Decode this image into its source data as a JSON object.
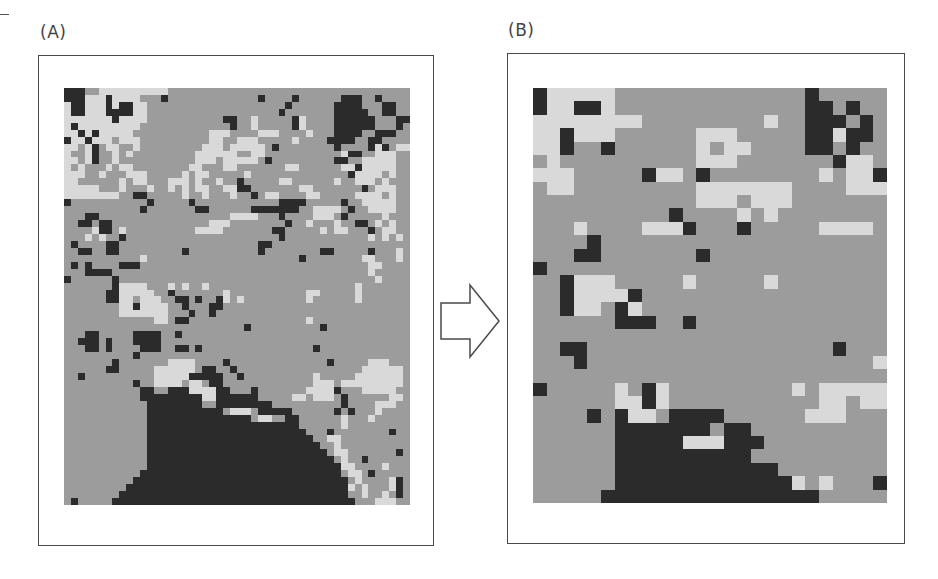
{
  "figure": {
    "panels": [
      {
        "label": "(A)",
        "description": "Fine-resolution classified grid map",
        "grid": {
          "cols": 50,
          "rows": 60,
          "legend": {
            ".": "medium grey class",
            "L": "light grey class",
            "D": "dark class"
          },
          "data": [
            "DDD..LLLLLLLLLL..................................",
            "DDDLLLDLLLL...D.............D....D......DDD..D.....",
            "LDDLLLDLDDLL....................D......DDDD...DD...",
            "LDDLLLDDDDLL...................D.......DDDDD..DD..",
            "LLLLLLLDLLLL...........DD..L.....DL....DDDDDD...DD.",
            "LDLLLLLLLLL.............D..L.....DL....DDDDDD...D.",
            "LLDLDLLLLL...........LLL....LLL....L...DDDD..DDD..",
            "DLLDLLL.LLL..........LL..LLL.....L....DDDD..DD...",
            "LL.LD.LL..L.........LLL.LLLLL.D........D....DLD.LL",
            "L..LD..L.L.........LLLLLL..LL...........LDD..LLL",
            "LL.LD..L...........LLL.LLLLL.D.........DD..LLLLL",
            "L.L...L.LL........LL...LL.......LL......LLDLLLLL.",
            "LLL..L...LLL.....L.LL.....L..............DLLLL.L",
            "LL......L.LL...LLL.L..L..D.....LL......L..LLL.L.",
            "LLLLL...L...L..L.L.LL..LLDD.......LL.......D.LLL.",
            "LLLLLLLL..DD.....L..L...L..D.LL....LL.....LLLL.L",
            "D...........D.....D............DDDD.....D..LLLLL.",
            "...........D.......DD......DDDDDDD..LLLL.D..LLLL",
            "...DD...................LLLL...D....LLL.D.....L..",
            "..DD.DD..............LLL........D..L...L..DD.L.L.",
            "....LDD.L..........LLLL.......DD.....L.LL...D.LL.",
            "...L.L..D......................D............L.L.L",
            ".D....DD....................DD....................",
            "..DD..DD.........D..........D........DD.....D...L.",
            "...........L......................D........LL...L",
            ".D.D....DDD.................................LL...",
            "...DDDD.....................................L.....",
            "D......D.....................................L....",
            ".......DLLLL...L.L..L.....................L......",
            "......DDLLLLL..D.......L...........LL.....L.....",
            "......DDLL.LLL..DD.D..DL.L.........L......L.....",
            "........LLDLLLL..D...DD.........................",
            "........LLLLLLL...D..D..........................",
            ".............LL.DD.................L............",
            "..........................D..........D...........",
            "...DD.....DDDD..D...............................",
            "..DDD.D...DDDD..................................",
            "...DD.D....DDD..DD.D................D............",
            "..........D......................................",
            ".......D.......LLLL....D..............D.....LLL...",
            "......DD.....LLLLLL.DD..D..................LLLLLL.",
            "..D..........LLLLLDDDDD..D..........L.....LLLLLLL",
            "..........D..LLLL.LL.DD.............LLL.LLLLLLLLL",
            "...........DD..DDDLLLLDD...D.......LLLLD...LLLLL",
            "...........DDDDDDDDDLLDDDDDD.....LL.LLL.D......LL",
            "............DDDDDDDD..DDDDDDDD..........D....LLL.",
            "............DDDDDDDDDDD.LLL.DDDDD......D.D...L...",
            "............DDDDDDDDDDDDDDD.LL..DD......L...L....",
            "............DDDDDDDDDDDDDDDDDDDDDD......L........",
            "............DDDDDDDDDDDDDDDDDDDDDDD...D........D.",
            "............DDDDDDDDDDDDDDDDDDDDDDDD..LL.......",
            "............DDDDDDDDDDDDDDDDDDDDDDDDD..L........",
            "............DDDDDDDDDDDDDDDDDDDDDDDDDD.LL.......D",
            "............DDDDDDDDDDDDDDDDDDDDDDDDDDD.L..D.....",
            "............DDDDDDDDDDDDDDDDDDDDDDDDDDDDLL....L..",
            "...........DDDDDDDDDDDDDDDDDDDDDDDDDDDDD.LL.D....",
            "..........DDDDDDDDDDDDDDDDDDDDDDDDDDDDDDD.L....LD",
            ".........DDDDDDDDDDDDDDDDDDDDDDDDDDDDDDDDL.L...LD",
            "........DDDDDDDDDDDDDDDDDDDDDDDDDDDDDDDDD..L..L.D",
            ".D.....DDDDDDDDDDDDDDDDDDDDDDDDDDDDDDDDDDD...LLL."
          ]
        }
      },
      {
        "label": "(B)",
        "description": "Coarser-resolution resampled grid map",
        "grid": {
          "cols": 26,
          "rows": 31,
          "legend": {
            ".": "medium grey class",
            "L": "light grey class",
            "D": "dark class"
          },
          "data": [
            "DLLLLL..............D.....",
            "DLLDDL..............DD.D..",
            "LLLLLLLL.........L..DDD.D.",
            "LLDLLL......LLL.....DDLDD.",
            "LLD..D......L.LL....DD.D..",
            ".L..........LLL.......DLL.",
            "LLL.....DLL.D........L.LLD",
            ".LL.........LLLLLLL....LLL",
            "............LLL.LLL.......",
            "..........D....L.L........",
            "...L....LLLD...D.....LLLL.",
            "....D.....................L",
            "...DD.......D.............L",
            "D.........................",
            "..DLLL.....L.....L........",
            "..DLLLLD..................",
            "..DLL.DL..................",
            "......DDD..D..............",
            "..........................",
            "..DD..................D...",
            "...D.....................L",
            "..........................",
            "D.....L.DL.........L.LLLLL",
            "......LLDL...........LL.LL",
            "....D.DLL.DDDD......LLL...",
            "......DDDDDDD.DD..........",
            "......DDDDDLLLDDD.........",
            "......DDDDDDDDDD..........",
            "......DDDDDDDDDDDD........",
            "......DDDDDDDDDDDDDL.L...D",
            ".....DDDDDDDDDDDDDDDD....."
          ]
        }
      }
    ],
    "arrow": {
      "direction": "right",
      "style": "outline"
    },
    "colors": {
      "grey": "#9c9c9c",
      "light": "#d9d9d9",
      "dark": "#2b2b2b",
      "frame": "#4a4a4a"
    }
  }
}
